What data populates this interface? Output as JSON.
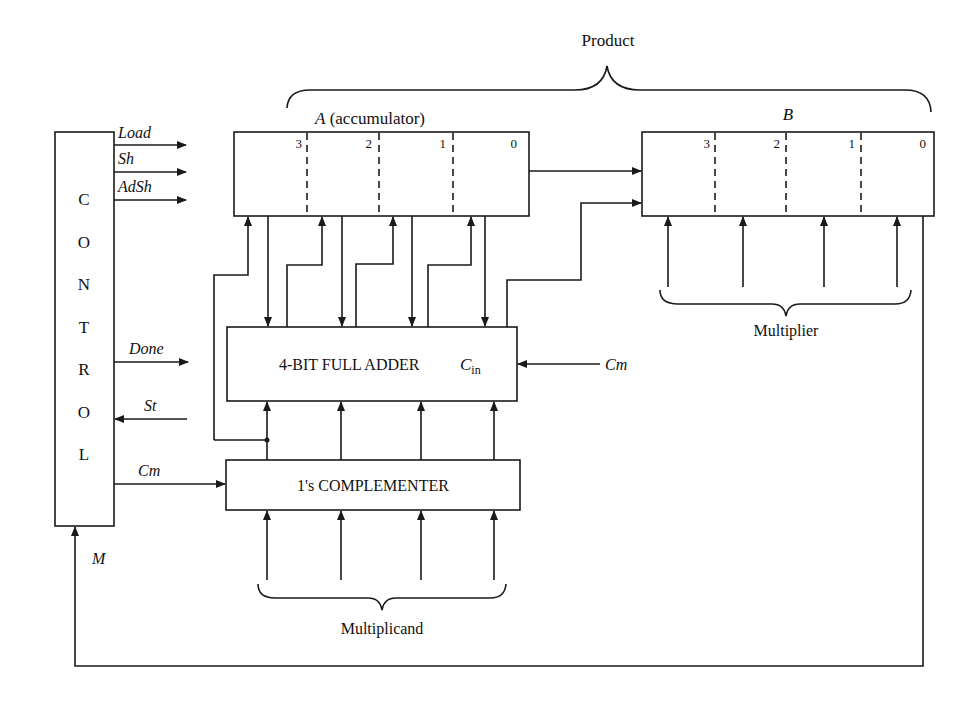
{
  "diagram": {
    "product_label": "Product",
    "accumulator": {
      "name": "A",
      "suffix": " (accumulator)",
      "bits": [
        "3",
        "2",
        "1",
        "0"
      ]
    },
    "multiplier_register": {
      "name": "B",
      "bits": [
        "3",
        "2",
        "1",
        "0"
      ]
    },
    "control": {
      "letters": [
        "C",
        "O",
        "N",
        "T",
        "R",
        "O",
        "L"
      ],
      "signals_out": [
        "Load",
        "Sh",
        "AdSh",
        "Done",
        "Cm"
      ],
      "signal_in_start": "St",
      "signal_in_m": "M"
    },
    "adder": {
      "label": "4-BIT FULL ADDER",
      "carry_in_main": "C",
      "carry_in_sub": "in",
      "carry_in_signal": "Cm"
    },
    "complementer": {
      "label": "1's COMPLEMENTER"
    },
    "multiplier_label": "Multiplier",
    "multiplicand_label": "Multiplicand"
  }
}
